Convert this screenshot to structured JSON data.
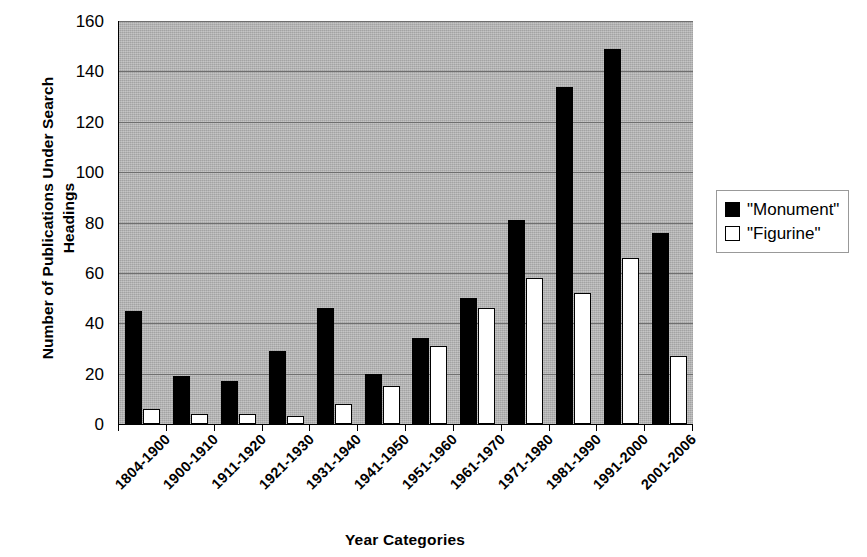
{
  "chart_data": {
    "type": "bar",
    "title": "",
    "xlabel": "Year Categories",
    "ylabel": "Number of Publications Under Search Headings",
    "ylabel_line1": "Number of Publications Under Search",
    "ylabel_line2": "Headings",
    "ylim": [
      0,
      160
    ],
    "ytick_step": 20,
    "yticks": [
      0,
      20,
      40,
      60,
      80,
      100,
      120,
      140,
      160
    ],
    "grid": true,
    "grid_axis": "y",
    "legend_position": "right",
    "plot_background": "#b3b3b3",
    "categories": [
      "1804-1900",
      "1900-1910",
      "1911-1920",
      "1921-1930",
      "1931-1940",
      "1941-1950",
      "1951-1960",
      "1961-1970",
      "1971-1980",
      "1981-1990",
      "1991-2000",
      "2001-2006"
    ],
    "series": [
      {
        "name": "\"Monument\"",
        "color": "#000000",
        "values": [
          45,
          19,
          17,
          29,
          46,
          20,
          34,
          50,
          81,
          134,
          149,
          76
        ]
      },
      {
        "name": "\"Figurine\"",
        "color": "#ffffff",
        "edge_color": "#000000",
        "values": [
          6,
          4,
          4,
          3,
          8,
          15,
          31,
          46,
          58,
          52,
          66,
          27
        ]
      }
    ]
  }
}
